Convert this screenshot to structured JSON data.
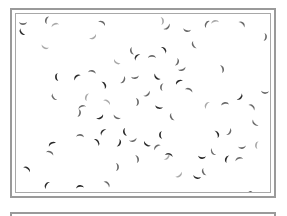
{
  "image": {
    "subject": "micrograph of crescent-shaped cells",
    "cell_color_dark": "#2a2a2a",
    "cell_color_mid": "#6a6a6a",
    "cell_color_light": "#a9a9a9",
    "background": "#ffffff",
    "border_color": "#9a9a9a",
    "cells": [
      [
        16,
        16,
        1
      ],
      [
        15,
        25,
        0
      ],
      [
        40,
        13,
        1
      ],
      [
        48,
        18,
        2
      ],
      [
        95,
        16,
        1
      ],
      [
        155,
        14,
        2
      ],
      [
        160,
        20,
        1
      ],
      [
        180,
        23,
        1
      ],
      [
        187,
        38,
        1
      ],
      [
        200,
        17,
        1
      ],
      [
        208,
        15,
        2
      ],
      [
        235,
        17,
        1
      ],
      [
        258,
        30,
        1
      ],
      [
        86,
        30,
        2
      ],
      [
        38,
        40,
        2
      ],
      [
        125,
        44,
        1
      ],
      [
        130,
        50,
        0
      ],
      [
        145,
        50,
        1
      ],
      [
        157,
        43,
        0
      ],
      [
        170,
        55,
        1
      ],
      [
        175,
        62,
        1
      ],
      [
        110,
        55,
        2
      ],
      [
        50,
        70,
        0
      ],
      [
        70,
        70,
        0
      ],
      [
        85,
        65,
        1
      ],
      [
        97,
        78,
        0
      ],
      [
        116,
        73,
        1
      ],
      [
        128,
        70,
        1
      ],
      [
        150,
        70,
        0
      ],
      [
        155,
        80,
        1
      ],
      [
        172,
        75,
        0
      ],
      [
        182,
        83,
        1
      ],
      [
        215,
        62,
        1
      ],
      [
        233,
        90,
        0
      ],
      [
        258,
        85,
        1
      ],
      [
        47,
        90,
        1
      ],
      [
        80,
        90,
        2
      ],
      [
        75,
        100,
        1
      ],
      [
        100,
        95,
        2
      ],
      [
        130,
        95,
        1
      ],
      [
        140,
        87,
        1
      ],
      [
        152,
        100,
        0
      ],
      [
        165,
        110,
        1
      ],
      [
        200,
        98,
        2
      ],
      [
        218,
        97,
        1
      ],
      [
        245,
        100,
        1
      ],
      [
        72,
        106,
        1
      ],
      [
        93,
        110,
        0
      ],
      [
        110,
        110,
        1
      ],
      [
        118,
        125,
        0
      ],
      [
        96,
        125,
        0
      ],
      [
        73,
        129,
        1
      ],
      [
        90,
        135,
        0
      ],
      [
        112,
        136,
        0
      ],
      [
        126,
        133,
        1
      ],
      [
        140,
        137,
        0
      ],
      [
        154,
        128,
        0
      ],
      [
        150,
        140,
        1
      ],
      [
        162,
        148,
        0
      ],
      [
        210,
        127,
        0
      ],
      [
        222,
        125,
        1
      ],
      [
        235,
        140,
        1
      ],
      [
        248,
        116,
        1
      ],
      [
        250,
        138,
        2
      ],
      [
        45,
        137,
        0
      ],
      [
        43,
        146,
        1
      ],
      [
        130,
        152,
        1
      ],
      [
        160,
        150,
        2
      ],
      [
        195,
        150,
        0
      ],
      [
        206,
        145,
        1
      ],
      [
        220,
        152,
        0
      ],
      [
        232,
        152,
        1
      ],
      [
        20,
        162,
        0
      ],
      [
        110,
        160,
        1
      ],
      [
        172,
        168,
        2
      ],
      [
        190,
        170,
        0
      ],
      [
        197,
        165,
        1
      ],
      [
        40,
        178,
        0
      ],
      [
        73,
        180,
        0
      ],
      [
        100,
        177,
        1
      ],
      [
        50,
        190,
        0
      ],
      [
        155,
        195,
        1
      ],
      [
        200,
        193,
        1
      ],
      [
        220,
        193,
        0
      ],
      [
        242,
        187,
        0
      ],
      [
        255,
        193,
        1
      ],
      [
        232,
        190,
        2
      ]
    ]
  },
  "frames": {
    "main_panel": "image-frame",
    "secondary_panel": "lower-frame"
  }
}
